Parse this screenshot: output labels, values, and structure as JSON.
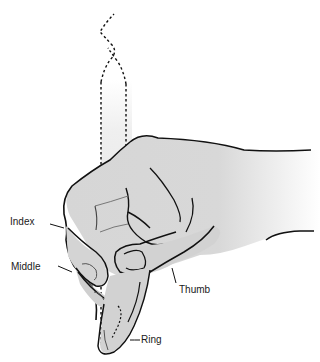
{
  "figure": {
    "colors": {
      "skin": "#d6d6d6",
      "outline": "#111111",
      "pencil_fill": "#ececec",
      "background": "#ffffff"
    }
  },
  "labels": {
    "index": "Index",
    "middle": "Middle",
    "thumb": "Thumb",
    "ring": "Ring"
  }
}
